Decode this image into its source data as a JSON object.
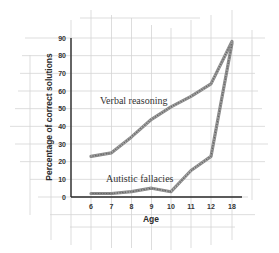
{
  "chart_data": {
    "type": "line",
    "title": "",
    "xlabel": "Age",
    "ylabel": "Percentage of correct solutions",
    "categories": [
      "6",
      "7",
      "8",
      "9",
      "10",
      "11",
      "12",
      "18"
    ],
    "x_tick_labels": [
      "6",
      "7",
      "8",
      "9",
      "10",
      "11",
      "12",
      "18"
    ],
    "y_tick_labels": [
      "0",
      "10",
      "20",
      "30",
      "40",
      "50",
      "60",
      "70",
      "80",
      "90"
    ],
    "ylim": [
      0,
      90
    ],
    "grid": true,
    "legend_position": "inline annotations",
    "series": [
      {
        "name": "Verbal reasoning",
        "values": [
          23,
          25,
          34,
          44,
          51,
          57,
          64,
          88
        ]
      },
      {
        "name": "Autistic fallacies",
        "values": [
          2,
          2,
          3,
          5,
          3,
          15,
          23,
          87
        ]
      }
    ],
    "annotations": [
      {
        "text": "Verbal reasoning",
        "near": "verbal series, ages 7–10"
      },
      {
        "text": "Autistic fallacies",
        "near": "autistic series, ages 7–10"
      }
    ]
  },
  "colors": {
    "line_band": "#8a8a8a",
    "axis": "#2a2a2a",
    "grid": "#d4d4d4",
    "text": "#333333"
  }
}
